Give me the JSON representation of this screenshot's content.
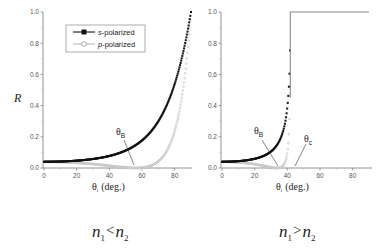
{
  "chart_data": [
    {
      "type": "line",
      "panel": "left",
      "title": "",
      "caption": "n1 < n2",
      "xlabel": "θi (deg.)",
      "ylabel": "R",
      "xlim": [
        0,
        90
      ],
      "ylim": [
        0,
        1.0
      ],
      "xticks": [
        0,
        20,
        40,
        60,
        80
      ],
      "yticks": [
        0.0,
        0.2,
        0.4,
        0.6,
        0.8,
        1.0
      ],
      "grid": false,
      "legend": {
        "position": "upper-left",
        "entries": [
          "s-polarized",
          "p-polarized"
        ]
      },
      "n1": 1.0,
      "n2": 1.5,
      "x": [
        0,
        10,
        20,
        30,
        40,
        50,
        56.3,
        60,
        70,
        80,
        85,
        90
      ],
      "series": [
        {
          "name": "s-polarized",
          "marker": "filled-square",
          "color": "#111111",
          "values": [
            0.04,
            0.042,
            0.049,
            0.061,
            0.082,
            0.118,
            0.148,
            0.178,
            0.299,
            0.528,
            0.712,
            1.0
          ]
        },
        {
          "name": "p-polarized",
          "marker": "open-circle",
          "color": "#aaaaaa",
          "values": [
            0.04,
            0.038,
            0.033,
            0.025,
            0.014,
            0.003,
            0.0,
            0.002,
            0.046,
            0.253,
            0.503,
            1.0
          ]
        }
      ],
      "annotations": [
        {
          "text": "θB",
          "x": 56.3,
          "y": 0.0
        }
      ]
    },
    {
      "type": "line",
      "panel": "right",
      "title": "",
      "caption": "n1 > n2",
      "xlabel": "θi (deg.)",
      "ylabel": "",
      "xlim": [
        0,
        90
      ],
      "ylim": [
        0,
        1.0
      ],
      "xticks": [
        0,
        20,
        40,
        60,
        80
      ],
      "yticks": [
        0.0,
        0.2,
        0.4,
        0.6,
        0.8,
        1.0
      ],
      "grid": false,
      "n1": 1.5,
      "n2": 1.0,
      "x": [
        0,
        10,
        20,
        30,
        33.7,
        36,
        38,
        40,
        41.0,
        41.8,
        60,
        90
      ],
      "series": [
        {
          "name": "s-polarized",
          "marker": "filled-square",
          "color": "#111111",
          "values": [
            0.04,
            0.043,
            0.058,
            0.111,
            0.157,
            0.197,
            0.253,
            0.367,
            0.478,
            1.0,
            1.0,
            1.0
          ]
        },
        {
          "name": "p-polarized",
          "marker": "open-circle",
          "color": "#aaaaaa",
          "values": [
            0.04,
            0.037,
            0.026,
            0.006,
            0.0,
            0.004,
            0.021,
            0.108,
            0.235,
            1.0,
            1.0,
            1.0
          ]
        }
      ],
      "annotations": [
        {
          "text": "θB",
          "x": 33.7,
          "y": 0.0
        },
        {
          "text": "θc",
          "x": 41.8,
          "y": 0.0
        }
      ]
    }
  ],
  "labels": {
    "y_axis_label": "R",
    "x_axis_theta": "θ",
    "x_axis_sub": "i",
    "x_axis_unit": "(deg.)",
    "legend_s_prefix": "s",
    "legend_s_suffix": "-polarized",
    "legend_p_prefix": "p",
    "legend_p_suffix": "-polarized",
    "theta_b": "θ",
    "theta_b_sub": "B",
    "theta_c": "θ",
    "theta_c_sub": "c",
    "caption_left_n1": "n",
    "caption_left_sub1": "1",
    "caption_left_op": "<",
    "caption_left_n2": "n",
    "caption_left_sub2": "2",
    "caption_right_n1": "n",
    "caption_right_sub1": "1",
    "caption_right_op": ">",
    "caption_right_n2": "n",
    "caption_right_sub2": "2"
  }
}
